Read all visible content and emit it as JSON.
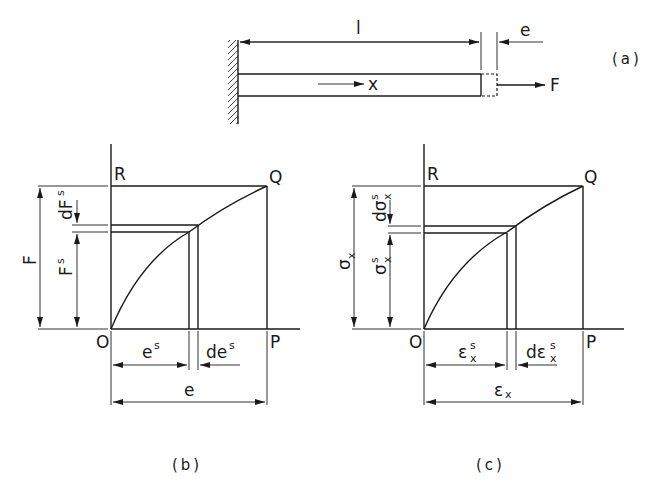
{
  "panel_a": {
    "caption": "(a)",
    "length_label": "l",
    "extension_label": "e",
    "axis_label": "x",
    "force_label": "F"
  },
  "panel_b": {
    "caption": "(b)",
    "origin": "O",
    "point_p": "P",
    "point_q": "Q",
    "point_r": "R",
    "y_total": "F",
    "y_partial": "F",
    "y_partial_sup": "s",
    "y_increment": "dF",
    "y_increment_sup": "s",
    "x_partial": "e",
    "x_partial_sup": "s",
    "x_increment": "de",
    "x_increment_sup": "s",
    "x_total": "e"
  },
  "panel_c": {
    "caption": "(c)",
    "origin": "O",
    "point_p": "P",
    "point_q": "Q",
    "point_r": "R",
    "y_total": "σ",
    "y_total_sub": "x",
    "y_partial": "σ",
    "y_partial_sup": "s",
    "y_partial_sub": "x",
    "y_increment": "dσ",
    "y_increment_sup": "s",
    "y_increment_sub": "x",
    "x_partial": "ε",
    "x_partial_sup": "s",
    "x_partial_sub": "x",
    "x_increment": "dε",
    "x_increment_sup": "s",
    "x_increment_sub": "x",
    "x_total": "ε",
    "x_total_sub": "x"
  }
}
